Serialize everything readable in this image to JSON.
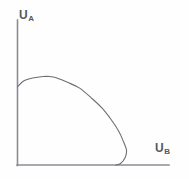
{
  "figure": {
    "background_color": "#fefefe",
    "line_color": "#6b6f74",
    "axis_color": "#8a8e93",
    "label_color": "#55595e"
  },
  "axes": {
    "y": {
      "symbol": "U",
      "subscript": "A",
      "label": "UA"
    },
    "x": {
      "symbol": "U",
      "subscript": "B",
      "label": "UB"
    }
  },
  "chart_data": {
    "type": "line",
    "xlabel": "UB",
    "ylabel": "UA",
    "grid": false,
    "legend": null,
    "axis_ticks": {
      "x": [],
      "y": []
    },
    "xlim": [
      0,
      100
    ],
    "ylim": [
      0,
      100
    ],
    "series": [
      {
        "name": "Utility possibility frontier",
        "x": [
          0,
          4,
          10,
          17,
          21,
          26,
          33,
          41,
          49,
          56,
          62,
          67,
          70,
          72,
          71,
          68,
          65
        ],
        "y": [
          54,
          58,
          60,
          61,
          61,
          60,
          57,
          53,
          46,
          39,
          31,
          23,
          16,
          10,
          5,
          1,
          0
        ],
        "closed": false,
        "style": "solid"
      }
    ],
    "annotations": []
  }
}
